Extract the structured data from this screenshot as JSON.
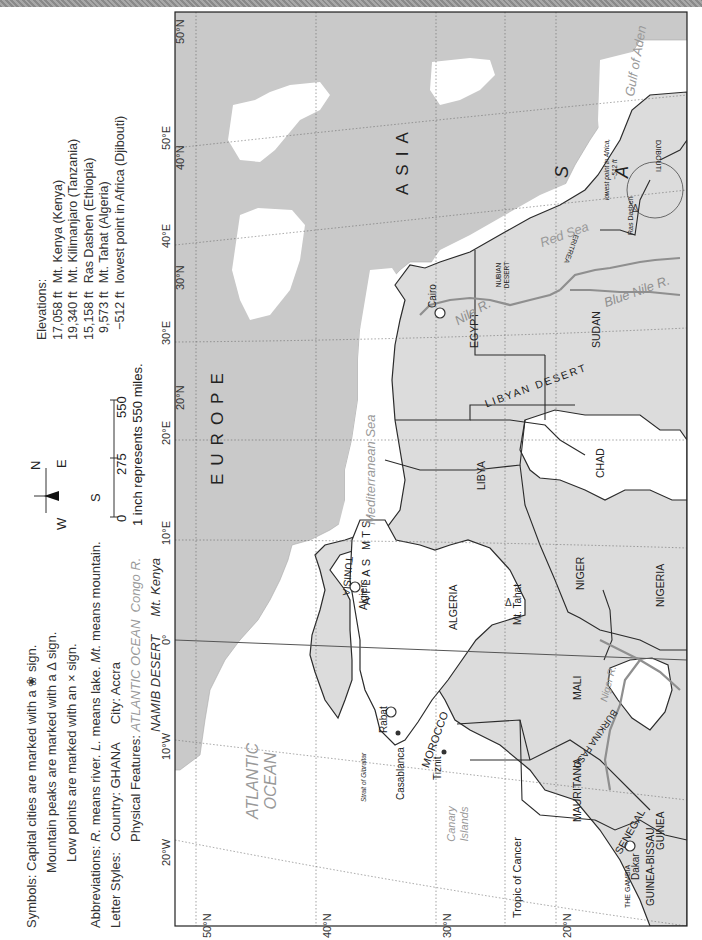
{
  "legend": {
    "symbols_label": "Symbols:",
    "symbols": [
      "Capital cities are marked with a ❀ sign.",
      "Mountain peaks are marked with a Δ sign.",
      "Low points are marked with an × sign."
    ],
    "abbreviations_label": "Abbreviations:",
    "abbreviations": [
      {
        "abbr": "R.",
        "meaning": "means river."
      },
      {
        "abbr": "L.",
        "meaning": "means lake."
      },
      {
        "abbr": "Mt.",
        "meaning": "means mountain."
      }
    ],
    "letter_styles_label": "Letter Styles:",
    "country_example": "Country: GHANA",
    "city_example": "City: Accra",
    "physical_label": "Physical Features:",
    "physical_examples": [
      "ATLANTIC OCEAN",
      "Congo R.",
      "NAMIB DESERT",
      "Mt. Kenya"
    ]
  },
  "compass": {
    "n": "N",
    "s": "S",
    "e": "E",
    "w": "W"
  },
  "scale": {
    "ticks": [
      "0",
      "275",
      "550"
    ],
    "caption": "1 inch represents 550 miles."
  },
  "elevations": {
    "title": "Elevations:",
    "rows": [
      {
        "value": "17,058 ft",
        "place": "Mt. Kenya (Kenya)"
      },
      {
        "value": "19,340 ft",
        "place": "Mt. Kilimanjaro (Tanzania)"
      },
      {
        "value": "15,158 ft",
        "place": "Ras Dashen (Ethiopia)"
      },
      {
        "value": "9,573 ft",
        "place": "Mt. Tahat (Algeria)"
      },
      {
        "value": "−512 ft",
        "place": "lowest point in Africa (Djibouti)"
      }
    ]
  },
  "map": {
    "latitude_labels": [
      "50°N",
      "40°N",
      "30°N",
      "20°N"
    ],
    "longitude_labels": [
      "20°W",
      "10°W",
      "0°",
      "10°E",
      "20°E",
      "30°E",
      "40°E",
      "50°E"
    ],
    "colors": {
      "land_gray": "#c9c9c9",
      "africa_shaded": "#dcdcdc",
      "white_country": "#ffffff",
      "water": "#ffffff",
      "river": "#8f8f8f",
      "border": "#2b2b2b"
    },
    "continents": [
      "EUROPE",
      "ASIA"
    ],
    "arabia_letters": [
      "S",
      "A"
    ],
    "countries": [
      "MOROCCO",
      "ALGERIA",
      "TUNISIA",
      "LIBYA",
      "EGYPT",
      "SUDAN",
      "CHAD",
      "NIGER",
      "NIGERIA",
      "MALI",
      "MAURITANIA",
      "SENEGAL",
      "BURKINA FASO",
      "GUINEA",
      "GUINEA-BISSAU",
      "THE GAMBIA",
      "ERITREA",
      "DJIBOUTI"
    ],
    "capitals": [
      "Cairo",
      "Algiers",
      "Rabat",
      "Dakar"
    ],
    "cities": [
      "Casablanca",
      "Tiznit"
    ],
    "water_bodies": [
      "ATLANTIC OCEAN",
      "Mediterranean Sea",
      "Red Sea",
      "Gulf of Aden",
      "Strait of Gibraltar"
    ],
    "rivers": [
      "Nile R.",
      "Blue Nile R.",
      "Niger R."
    ],
    "deserts": [
      "LIBYAN DESERT",
      "NUBIAN DESERT"
    ],
    "mountains": [
      "ATLAS MTS.",
      "Mt. Tahat",
      "Ras Dashen"
    ],
    "islands": [
      "Canary Islands"
    ],
    "other": [
      "Tropic of Cancer"
    ],
    "lowest_point_note": [
      "lowest point in Africa,",
      "−512 ft"
    ]
  }
}
